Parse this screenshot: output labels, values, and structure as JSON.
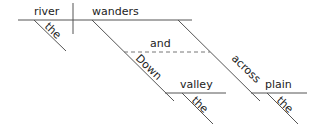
{
  "diagram": {
    "type": "sentence-diagram",
    "subject": {
      "word": "river",
      "modifier": "the"
    },
    "predicate": {
      "word": "wanders"
    },
    "conjunction": "and",
    "phrases": [
      {
        "preposition": "Down",
        "object": "valley",
        "modifier": "the"
      },
      {
        "preposition": "across",
        "object": "plain",
        "modifier": "the"
      }
    ],
    "colors": {
      "line": "#555555",
      "text": "#222222",
      "background": "#ffffff"
    }
  }
}
